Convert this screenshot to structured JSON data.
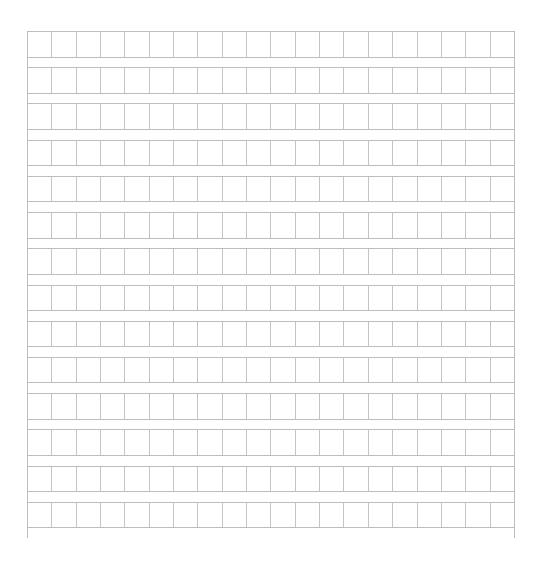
{
  "paper": {
    "type": "square-grid-composition-paper",
    "rows": 14,
    "columns": 20,
    "line_color": "#bdbdbd",
    "background": "#ffffff"
  }
}
